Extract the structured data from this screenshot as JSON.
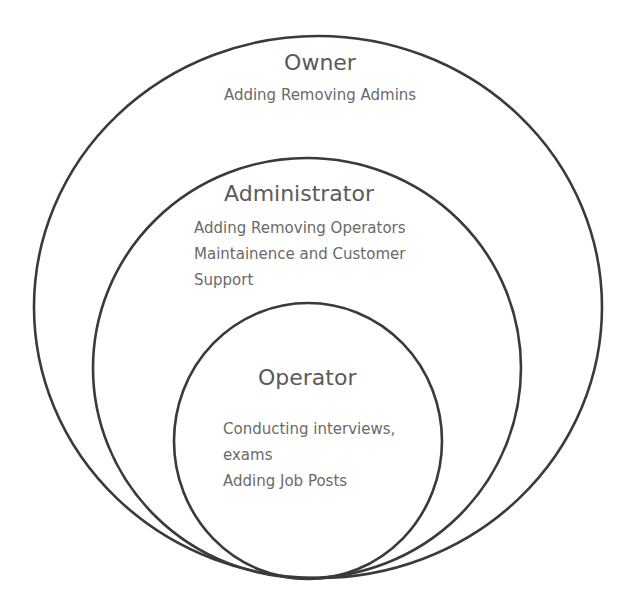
{
  "diagram": {
    "type": "nested-circles",
    "stroke_color": "#3a3a3a",
    "text_color": "#5f5f5f",
    "background": "#ffffff",
    "levels": [
      {
        "title": "Owner",
        "lines": [
          "Adding Removing Admins"
        ]
      },
      {
        "title": "Administrator",
        "lines": [
          "Adding Removing  Operators",
          "Maintainence and Customer",
          "Support"
        ]
      },
      {
        "title": "Operator",
        "lines": [
          "Conducting interviews,",
          "exams",
          "Adding Job Posts"
        ]
      }
    ]
  }
}
